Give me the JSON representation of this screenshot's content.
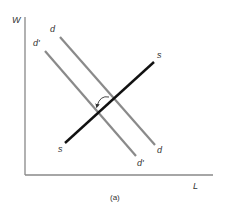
{
  "diagram": {
    "caption": "(a)",
    "axes": {
      "y_label": "W",
      "x_label": "L",
      "color": "#888888"
    },
    "curves": {
      "demand": {
        "label_top": "d",
        "label_bottom": "d",
        "color": "#8a8a8a"
      },
      "demand_shifted": {
        "label_top": "d'",
        "label_bottom": "d'",
        "color": "#8a8a8a"
      },
      "supply": {
        "label_top": "s",
        "label_bottom": "s",
        "color": "#111111"
      }
    },
    "annotation": {
      "shift_arrow": "curved arrow indicating demand shift from d to d'"
    }
  }
}
